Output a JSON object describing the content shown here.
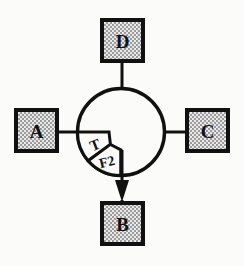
{
  "diagram": {
    "type": "schematic-node-graph",
    "background_color": "#fbfbfa",
    "stroke_color": "#111111",
    "box_fill_pattern": "checkered-dot",
    "box_fill_color": "#d8d8d8",
    "central_element": {
      "name": "circle",
      "center_x": 121,
      "center_y": 132,
      "radius": 44
    },
    "nodes": [
      {
        "id": "node-d",
        "label": "D",
        "position": "top",
        "x": 102,
        "y": 20,
        "w": 41,
        "h": 41
      },
      {
        "id": "node-a",
        "label": "A",
        "position": "left",
        "x": 16,
        "y": 110,
        "w": 41,
        "h": 41
      },
      {
        "id": "node-c",
        "label": "C",
        "position": "right",
        "x": 187,
        "y": 110,
        "w": 41,
        "h": 41
      },
      {
        "id": "node-b",
        "label": "B",
        "position": "bottom",
        "x": 102,
        "y": 203,
        "w": 41,
        "h": 41
      }
    ],
    "connectors": [
      {
        "id": "connector-d",
        "from": "node-d",
        "to": "circle",
        "arrow": false
      },
      {
        "id": "connector-a",
        "from": "node-a",
        "to": "circle",
        "arrow": false
      },
      {
        "id": "connector-c",
        "from": "circle",
        "to": "node-c",
        "arrow": false
      },
      {
        "id": "connector-b",
        "from": "circle",
        "to": "node-b",
        "arrow": true
      }
    ],
    "sectors": [
      {
        "id": "sector-t",
        "label": "T",
        "quadrant": "lower-left",
        "angle_start_deg": 180,
        "angle_end_deg": 215
      },
      {
        "id": "sector-f2",
        "label": "F2",
        "quadrant": "lower-left",
        "angle_start_deg": 215,
        "angle_end_deg": 250
      }
    ]
  }
}
